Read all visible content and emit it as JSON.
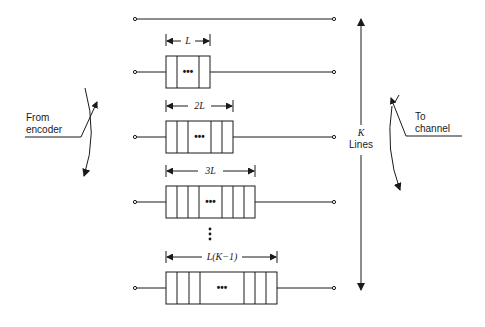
{
  "diagram": {
    "colors": {
      "ink": "#1a1a1a",
      "background": "#ffffff"
    },
    "input_switch": {
      "label_line1": "From",
      "label_line2": "encoder"
    },
    "output_switch": {
      "label_line1": "To",
      "label_line2": "channel"
    },
    "k_indicator": {
      "label_line1": "K",
      "label_line2": "Lines"
    },
    "lines": [
      {
        "index": 0,
        "delay_label": "",
        "has_register": false
      },
      {
        "index": 1,
        "delay_label": "L",
        "has_register": true,
        "ellipsis": "•••"
      },
      {
        "index": 2,
        "delay_label": "2L",
        "has_register": true,
        "ellipsis": "•••"
      },
      {
        "index": 3,
        "delay_label": "3L",
        "has_register": true,
        "ellipsis": "•••"
      },
      {
        "index": 4,
        "delay_label": "L(K−1)",
        "has_register": true,
        "ellipsis": "•••"
      }
    ],
    "vertical_ellipsis": "⋮"
  }
}
